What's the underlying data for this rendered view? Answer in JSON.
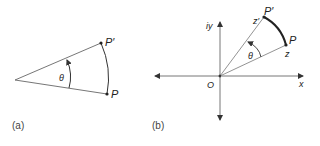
{
  "figure_a": {
    "caption": "(a)",
    "angle_label": "θ",
    "point_start_label": "P",
    "point_end_label": "P′"
  },
  "figure_b": {
    "caption": "(b)",
    "angle_label": "θ",
    "origin_label": "O",
    "x_axis_label": "x",
    "y_axis_label": "iy",
    "point_start_label": "P",
    "point_end_label": "P′",
    "complex_start_label": "z",
    "complex_end_label": "z′"
  },
  "colors": {
    "line": "#555555",
    "thick_arc": "#222222"
  }
}
